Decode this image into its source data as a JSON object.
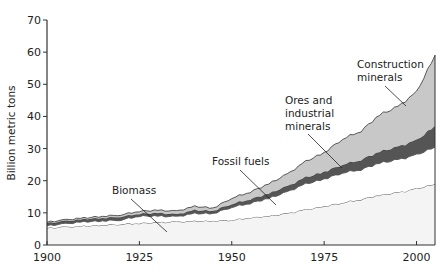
{
  "chart_data": {
    "type": "area",
    "stacked": true,
    "title": "",
    "xlabel": "",
    "ylabel": "Billion metric tons",
    "xlim": [
      1900,
      2005
    ],
    "ylim": [
      0,
      70
    ],
    "x_ticks": [
      1900,
      1925,
      1950,
      1975,
      2000
    ],
    "y_ticks": [
      0,
      10,
      20,
      30,
      40,
      50,
      60,
      70
    ],
    "grid": false,
    "legend": "inline annotations",
    "x": [
      1900,
      1905,
      1910,
      1915,
      1920,
      1925,
      1930,
      1935,
      1940,
      1945,
      1950,
      1955,
      1960,
      1965,
      1970,
      1975,
      1980,
      1985,
      1990,
      1995,
      2000,
      2005
    ],
    "series": [
      {
        "name": "Biomass",
        "color": "#f4f4f4",
        "values": [
          5.3,
          0.3,
          0.3,
          0.3,
          0.3,
          0.3,
          0.2,
          0.2,
          0.2,
          0.1,
          0.3,
          0.7,
          0.5,
          0.8,
          1.2,
          1.0,
          1.2,
          1.0,
          1.3,
          0.8,
          1.2,
          1.5
        ],
        "cumulative_top": [
          5.3,
          5.6,
          5.9,
          6.2,
          6.5,
          6.8,
          7.0,
          7.2,
          7.4,
          7.5,
          7.8,
          8.5,
          9.0,
          9.8,
          11.0,
          12.0,
          13.2,
          14.2,
          15.5,
          16.3,
          17.5,
          19.0
        ]
      },
      {
        "name": "Fossil fuels",
        "color": "#ffffff",
        "cumulative_top": [
          6.0,
          6.6,
          7.2,
          7.5,
          7.8,
          9.0,
          9.0,
          8.8,
          9.8,
          9.8,
          11.8,
          13.0,
          14.5,
          16.5,
          19.0,
          20.5,
          22.5,
          23.5,
          25.5,
          26.5,
          28.0,
          30.5
        ]
      },
      {
        "name": "Ores and industrial minerals",
        "color": "#555555",
        "cumulative_top": [
          6.8,
          7.4,
          8.0,
          8.4,
          8.8,
          9.7,
          9.9,
          9.5,
          10.8,
          10.6,
          12.8,
          14.2,
          16.0,
          18.2,
          21.0,
          22.7,
          25.0,
          26.5,
          29.0,
          30.5,
          32.5,
          37.0
        ]
      },
      {
        "name": "Construction minerals",
        "color": "#c8c8c8",
        "cumulative_top": [
          7.1,
          7.8,
          8.4,
          8.9,
          9.4,
          10.5,
          10.8,
          10.5,
          12.0,
          11.5,
          14.6,
          16.5,
          19.0,
          22.0,
          26.0,
          28.7,
          33.0,
          35.5,
          40.5,
          43.0,
          47.5,
          59.0
        ]
      }
    ],
    "annotations": [
      {
        "text": [
          "Construction",
          "minerals"
        ],
        "series": "Construction minerals"
      },
      {
        "text": [
          "Ores and",
          "industrial",
          "minerals"
        ],
        "series": "Ores and industrial minerals"
      },
      {
        "text": [
          "Fossil fuels"
        ],
        "series": "Fossil fuels"
      },
      {
        "text": [
          "Biomass"
        ],
        "series": "Biomass"
      }
    ]
  },
  "labels": {
    "ylabel": "Billion metric tons",
    "anno_construction_1": "Construction",
    "anno_construction_2": "minerals",
    "anno_ores_1": "Ores and",
    "anno_ores_2": "industrial",
    "anno_ores_3": "minerals",
    "anno_fossil": "Fossil fuels",
    "anno_biomass": "Biomass"
  }
}
